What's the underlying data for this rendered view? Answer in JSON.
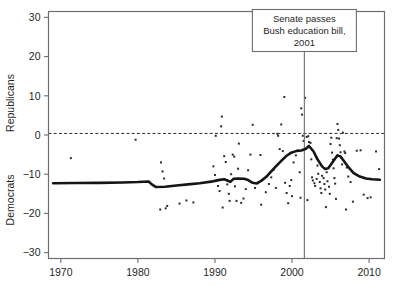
{
  "chart_data": {
    "type": "scatter",
    "title": "",
    "xlabel": "",
    "ylabel_top": "Republicans",
    "ylabel_bottom": "Democrats",
    "xlim": [
      1968.4,
      2012.0
    ],
    "ylim": [
      -31.5,
      31.5
    ],
    "xticks": [
      1970,
      1980,
      1990,
      2000,
      2010
    ],
    "xticklabels": [
      "1970",
      "1980",
      "1990",
      "2000",
      "2010"
    ],
    "yticks": [
      -30,
      -20,
      -10,
      0,
      10,
      20,
      30
    ],
    "yticklabels": [
      "-30",
      "-20",
      "-10",
      "0",
      "10",
      "20",
      "30"
    ],
    "grid": false,
    "legend": "none",
    "zero_reference_line": {
      "y": 0.4,
      "style": "dashed",
      "color": "#2b2b2b"
    },
    "event_line": {
      "x": 2001.6,
      "style": "solid",
      "color": "#6e6e6e"
    },
    "annotation": {
      "lines": [
        "Senate passes",
        "Bush education bill,",
        "2001"
      ],
      "box_border_color": "#6e6e6e",
      "box_fill": "#ffffff"
    },
    "trend_color": "#151515",
    "point_color": "#2b2b2b",
    "series": [
      {
        "name": "loess-trend",
        "type": "line",
        "points": [
          [
            1969.0,
            -12.3
          ],
          [
            1972.0,
            -12.25
          ],
          [
            1975.0,
            -12.2
          ],
          [
            1978.0,
            -12.1
          ],
          [
            1980.0,
            -12.0
          ],
          [
            1981.4,
            -11.85
          ],
          [
            1981.8,
            -12.6
          ],
          [
            1982.3,
            -13.25
          ],
          [
            1983.5,
            -13.2
          ],
          [
            1985.0,
            -12.9
          ],
          [
            1986.5,
            -12.6
          ],
          [
            1988.0,
            -12.3
          ],
          [
            1989.5,
            -11.9
          ],
          [
            1990.6,
            -11.45
          ],
          [
            1991.2,
            -11.3
          ],
          [
            1991.6,
            -11.6
          ],
          [
            1992.0,
            -11.95
          ],
          [
            1992.4,
            -11.2
          ],
          [
            1993.0,
            -11.1
          ],
          [
            1993.8,
            -11.15
          ],
          [
            1994.3,
            -11.5
          ],
          [
            1994.9,
            -12.2
          ],
          [
            1995.4,
            -12.35
          ],
          [
            1996.0,
            -11.7
          ],
          [
            1996.7,
            -10.6
          ],
          [
            1997.3,
            -9.3
          ],
          [
            1998.0,
            -7.8
          ],
          [
            1998.7,
            -6.4
          ],
          [
            1999.3,
            -5.3
          ],
          [
            1999.9,
            -4.5
          ],
          [
            2000.6,
            -4.05
          ],
          [
            2001.2,
            -3.95
          ],
          [
            2001.8,
            -3.5
          ],
          [
            2002.2,
            -2.8
          ],
          [
            2002.8,
            -4.2
          ],
          [
            2003.3,
            -6.2
          ],
          [
            2003.9,
            -8.0
          ],
          [
            2004.3,
            -8.7
          ],
          [
            2004.7,
            -8.5
          ],
          [
            2005.1,
            -7.4
          ],
          [
            2005.6,
            -6.0
          ],
          [
            2005.9,
            -5.2
          ],
          [
            2006.3,
            -5.5
          ],
          [
            2006.8,
            -6.8
          ],
          [
            2007.4,
            -8.4
          ],
          [
            2008.0,
            -9.7
          ],
          [
            2008.8,
            -10.6
          ],
          [
            2009.6,
            -11.1
          ],
          [
            2010.4,
            -11.3
          ],
          [
            2011.4,
            -11.4
          ]
        ]
      },
      {
        "name": "observations",
        "type": "scatter",
        "points": [
          [
            1971.3,
            -5.9
          ],
          [
            1979.7,
            -1.2
          ],
          [
            1983.0,
            -7.0
          ],
          [
            1983.2,
            -9.3
          ],
          [
            1983.4,
            -11.1
          ],
          [
            1982.9,
            -19.0
          ],
          [
            1983.6,
            -18.7
          ],
          [
            1983.8,
            -18.1
          ],
          [
            1985.4,
            -17.5
          ],
          [
            1986.3,
            -16.7
          ],
          [
            1987.2,
            -17.2
          ],
          [
            1989.8,
            -8.0
          ],
          [
            1990.0,
            -10.2
          ],
          [
            1990.2,
            -11.6
          ],
          [
            1990.4,
            -13.0
          ],
          [
            1990.6,
            -14.3
          ],
          [
            1990.9,
            4.7
          ],
          [
            1990.8,
            2.2
          ],
          [
            1991.2,
            -5.4
          ],
          [
            1991.4,
            -6.9
          ],
          [
            1991.6,
            -12.6
          ],
          [
            1991.8,
            -15.0
          ],
          [
            1991.9,
            -16.8
          ],
          [
            1992.1,
            -10.0
          ],
          [
            1992.3,
            -5.0
          ],
          [
            1992.5,
            -5.5
          ],
          [
            1992.6,
            -13.1
          ],
          [
            1992.8,
            -16.8
          ],
          [
            1993.1,
            -2.2
          ],
          [
            1993.4,
            -17.3
          ],
          [
            1993.7,
            -16.2
          ],
          [
            1994.0,
            -13.8
          ],
          [
            1994.3,
            -9.0
          ],
          [
            1994.6,
            -5.0
          ],
          [
            1994.9,
            2.6
          ],
          [
            1995.2,
            -13.5
          ],
          [
            1995.6,
            -12.3
          ],
          [
            1996.0,
            -17.8
          ],
          [
            1996.6,
            -14.6
          ],
          [
            1997.0,
            -12.5
          ],
          [
            1997.3,
            -10.8
          ],
          [
            1997.6,
            -8.9
          ],
          [
            1997.9,
            -13.5
          ],
          [
            1998.1,
            0.3
          ],
          [
            1998.2,
            -0.2
          ],
          [
            1998.4,
            -3.6
          ],
          [
            1998.6,
            2.7
          ],
          [
            1998.8,
            -4.1
          ],
          [
            1999.0,
            9.7
          ],
          [
            1999.1,
            -12.2
          ],
          [
            1999.3,
            -14.8
          ],
          [
            1999.5,
            -17.4
          ],
          [
            1999.7,
            -13.0
          ],
          [
            1999.9,
            -11.5
          ],
          [
            2000.2,
            -7.0
          ],
          [
            2000.5,
            -5.2
          ],
          [
            2000.8,
            -4.0
          ],
          [
            2001.0,
            -9.5
          ],
          [
            2001.2,
            6.8
          ],
          [
            2001.3,
            5.2
          ],
          [
            2001.4,
            -0.2
          ],
          [
            2001.5,
            -1.5
          ],
          [
            2001.7,
            9.5
          ],
          [
            2001.9,
            -0.5
          ],
          [
            2002.1,
            -0.3
          ],
          [
            2002.2,
            -1.8
          ],
          [
            2002.4,
            -2.0
          ],
          [
            2002.5,
            -6.2
          ],
          [
            2002.6,
            -10.8
          ],
          [
            2002.7,
            -11.6
          ],
          [
            2002.9,
            -12.3
          ],
          [
            2003.0,
            -13.0
          ],
          [
            2003.2,
            -11.2
          ],
          [
            2003.3,
            -7.8
          ],
          [
            2003.4,
            -9.9
          ],
          [
            2003.6,
            -12.0
          ],
          [
            2003.7,
            -13.6
          ],
          [
            2003.8,
            -14.8
          ],
          [
            2003.9,
            -10.4
          ],
          [
            2004.1,
            -11.0
          ],
          [
            2004.2,
            -12.5
          ],
          [
            2004.3,
            -13.9
          ],
          [
            2004.5,
            -9.5
          ],
          [
            2004.6,
            -11.8
          ],
          [
            2004.8,
            -13.2
          ],
          [
            2004.9,
            -15.0
          ],
          [
            2005.0,
            -2.3
          ],
          [
            2005.1,
            -0.7
          ],
          [
            2005.2,
            -4.5
          ],
          [
            2005.3,
            -6.3
          ],
          [
            2005.4,
            -8.5
          ],
          [
            2005.5,
            -11.0
          ],
          [
            2005.6,
            -12.4
          ],
          [
            2005.8,
            -0.8
          ],
          [
            2005.9,
            2.8
          ],
          [
            2006.0,
            1.3
          ],
          [
            2006.1,
            -0.9
          ],
          [
            2006.2,
            -2.6
          ],
          [
            2006.3,
            -4.4
          ],
          [
            2006.4,
            -5.8
          ],
          [
            2006.5,
            -7.5
          ],
          [
            2006.6,
            0.6
          ],
          [
            2006.8,
            -4.2
          ],
          [
            2006.9,
            -4.6
          ],
          [
            2007.1,
            -8.3
          ],
          [
            2007.3,
            -10.6
          ],
          [
            2007.6,
            -12.0
          ],
          [
            2007.9,
            -17.0
          ],
          [
            2008.4,
            -4.0
          ],
          [
            2008.9,
            -3.9
          ],
          [
            2009.3,
            -15.2
          ],
          [
            2009.8,
            -16.1
          ],
          [
            2010.2,
            -15.9
          ],
          [
            2010.9,
            -4.2
          ],
          [
            2011.3,
            -8.7
          ],
          [
            1990.1,
            -0.2
          ],
          [
            1993.0,
            -8.6
          ],
          [
            1995.9,
            -5.1
          ],
          [
            2000.0,
            -15.6
          ],
          [
            2001.1,
            -16.0
          ],
          [
            2002.0,
            -16.6
          ],
          [
            2004.4,
            -18.4
          ],
          [
            2005.7,
            -16.3
          ],
          [
            2007.0,
            -19.0
          ],
          [
            1991.0,
            -18.5
          ]
        ]
      }
    ]
  }
}
